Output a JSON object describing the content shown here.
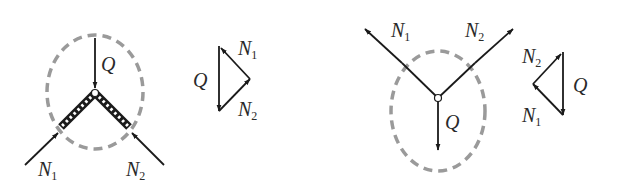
{
  "figures": [
    {
      "id": "left-structure",
      "labels": {
        "load": "Q",
        "force1": "N",
        "force1_sub": "1",
        "force2": "N",
        "force2_sub": "2"
      }
    },
    {
      "id": "left-force-triangle",
      "labels": {
        "load": "Q",
        "force1": "N",
        "force1_sub": "1",
        "force2": "N",
        "force2_sub": "2"
      }
    },
    {
      "id": "right-structure",
      "labels": {
        "load": "Q",
        "force1": "N",
        "force1_sub": "1",
        "force2": "N",
        "force2_sub": "2"
      }
    },
    {
      "id": "right-force-triangle",
      "labels": {
        "load": "Q",
        "force1": "N",
        "force1_sub": "1",
        "force2": "N",
        "force2_sub": "2"
      }
    }
  ],
  "colors": {
    "line": "#1a1a1a",
    "dashed_outline": "#9a9a9a",
    "beam_fill": "#1a1a1a",
    "beam_dots": "#ffffff"
  }
}
